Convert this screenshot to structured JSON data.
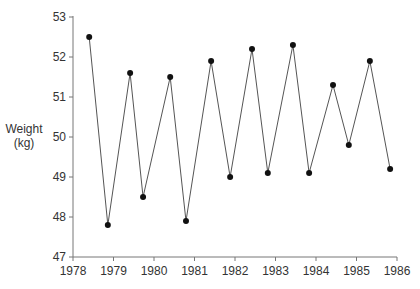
{
  "chart_data": {
    "type": "line",
    "title": "",
    "xlabel": "",
    "ylabel": "Weight (kg)",
    "ylabel_lines": [
      "Weight",
      "(kg)"
    ],
    "xlim": [
      1978,
      1986
    ],
    "ylim": [
      47,
      53
    ],
    "xticks": [
      1978,
      1979,
      1980,
      1981,
      1982,
      1983,
      1984,
      1985,
      1986
    ],
    "yticks": [
      47,
      48,
      49,
      50,
      51,
      52,
      53
    ],
    "grid": false,
    "legend": null,
    "series": [
      {
        "name": "Weight",
        "color": "#555555",
        "marker": "circle",
        "x": [
          1978.4,
          1978.86,
          1979.41,
          1979.73,
          1980.4,
          1980.79,
          1981.41,
          1981.88,
          1982.42,
          1982.81,
          1983.43,
          1983.83,
          1984.42,
          1984.81,
          1985.33,
          1985.83
        ],
        "values": [
          52.5,
          47.8,
          51.6,
          48.5,
          51.5,
          47.9,
          51.9,
          49.0,
          52.2,
          49.1,
          52.3,
          49.1,
          51.3,
          49.8,
          51.9,
          49.2
        ]
      }
    ]
  }
}
